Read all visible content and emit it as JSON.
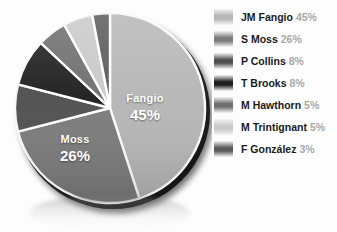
{
  "chart_data": {
    "type": "pie",
    "title": "",
    "labels": [
      "JM Fangio",
      "S Moss",
      "P Collins",
      "T Brooks",
      "M Hawthorn",
      "M Trintignant",
      "F González"
    ],
    "values": [
      45,
      26,
      8,
      8,
      5,
      5,
      3
    ],
    "value_suffix": "%",
    "legend_position": "right",
    "grid": false,
    "colors": [
      "#b6b6b6",
      "#7b7b7b",
      "#4f4f4f",
      "#1f1f1f",
      "#6e6e6e",
      "#c9c9c9",
      "#5a5a5a"
    ],
    "slice_separator_color": "#ffffff",
    "start_angle_deg": 0,
    "direction": "clockwise",
    "inner_labels": [
      {
        "name": "Fangio",
        "percent": "45%"
      },
      {
        "name": "Moss",
        "percent": "26%"
      }
    ]
  },
  "legend": {
    "items": [
      {
        "name": "JM Fangio",
        "percent": "45%",
        "color": "#b6b6b6"
      },
      {
        "name": "S Moss",
        "percent": "26%",
        "color": "#7b7b7b"
      },
      {
        "name": "P Collins",
        "percent": "8%",
        "color": "#4f4f4f"
      },
      {
        "name": "T Brooks",
        "percent": "8%",
        "color": "#1f1f1f"
      },
      {
        "name": "M Hawthorn",
        "percent": "5%",
        "color": "#6e6e6e"
      },
      {
        "name": "M Trintignant",
        "percent": "5%",
        "color": "#c9c9c9"
      },
      {
        "name": "F González",
        "percent": "3%",
        "color": "#5a5a5a"
      }
    ]
  },
  "colors": {
    "background": "#fdfdfd",
    "legend_name": "#1a1a1a",
    "legend_percent": "#a8a8a8",
    "pie_rim": "#151515",
    "label_text": "#ffffff"
  }
}
